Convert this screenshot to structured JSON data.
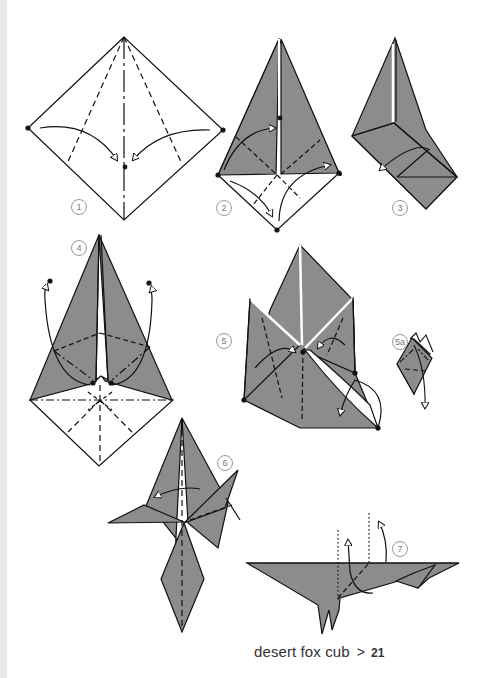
{
  "document": {
    "type": "origami instruction page",
    "colors": {
      "background": "#ffffff",
      "paper_fill": "#8c8c8c",
      "line": "#111111",
      "edge_stripe": "#e9e9e9",
      "step_circle": "#9a9a9a"
    }
  },
  "steps": [
    {
      "label": "1"
    },
    {
      "label": "2"
    },
    {
      "label": "3"
    },
    {
      "label": "4"
    },
    {
      "label": "5"
    },
    {
      "label": "5a"
    },
    {
      "label": "6"
    },
    {
      "label": "7"
    }
  ],
  "footer": {
    "title": "desert fox cub",
    "separator": ">",
    "page_number": "21"
  }
}
